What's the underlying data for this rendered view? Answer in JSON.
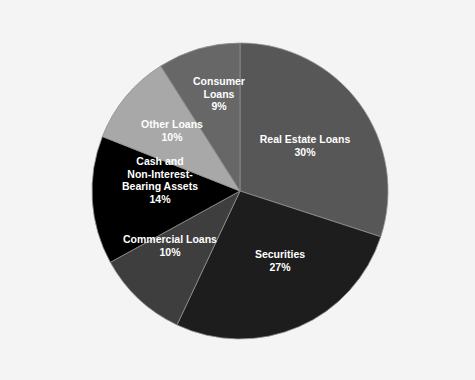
{
  "page": {
    "background_color": "#f4f4f5",
    "cropped_header_text": ""
  },
  "chart_data": {
    "type": "pie",
    "title": "",
    "subtitle": "",
    "xlabel": "",
    "ylabel": "",
    "legend_position": "none",
    "grid": false,
    "label_format": "name_and_percent",
    "label_color": "#ffffff",
    "slice_border_color": "#8f8f94",
    "start_angle_deg": 0,
    "direction": "clockwise",
    "center": {
      "x": 240,
      "y": 191
    },
    "radius": 148,
    "categories": [
      "Real Estate Loans",
      "Securities",
      "Commercial Loans",
      "Cash and Non-Interest-Bearing Assets",
      "Other Loans",
      "Consumer Loans"
    ],
    "values": [
      30,
      27,
      10,
      14,
      10,
      9
    ],
    "total": 100,
    "slices": [
      {
        "name": "Real Estate Loans",
        "value": 30,
        "percent_label": "30%",
        "color": "#575757",
        "label_lines": [
          "Real Estate Loans",
          "30%"
        ],
        "label_x": 305,
        "label_y": 140
      },
      {
        "name": "Securities",
        "value": 27,
        "percent_label": "27%",
        "color": "#1d1d1d",
        "label_lines": [
          "Securities",
          "27%"
        ],
        "label_x": 280,
        "label_y": 255
      },
      {
        "name": "Commercial Loans",
        "value": 10,
        "percent_label": "10%",
        "color": "#3e3e3e",
        "label_lines": [
          "Commercial Loans",
          "10%"
        ],
        "label_x": 170,
        "label_y": 240
      },
      {
        "name": "Cash and Non-Interest-Bearing Assets",
        "value": 14,
        "percent_label": "14%",
        "color": "#000000",
        "label_lines": [
          "Cash and",
          "Non-Interest-",
          "Bearing Assets",
          "14%"
        ],
        "label_x": 160,
        "label_y": 162
      },
      {
        "name": "Other Loans",
        "value": 10,
        "percent_label": "10%",
        "color": "#a8a8a8",
        "label_lines": [
          "Other Loans",
          "10%"
        ],
        "label_x": 172,
        "label_y": 125
      },
      {
        "name": "Consumer Loans",
        "value": 9,
        "percent_label": "9%",
        "color": "#676767",
        "label_lines": [
          "Consumer",
          "Loans",
          "9%"
        ],
        "label_x": 219,
        "label_y": 82
      }
    ]
  }
}
